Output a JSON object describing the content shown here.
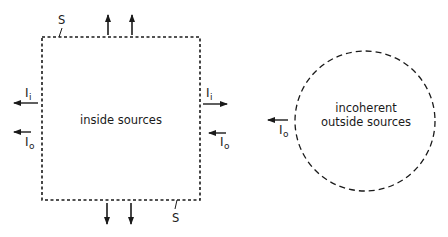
{
  "diagram": {
    "type": "radiation-surface-schematic",
    "colors": {
      "stroke": "#1a1a1a",
      "background": "#ffffff"
    },
    "surface": {
      "label_top": "S",
      "label_bottom": "S",
      "style": "dotted-rectangle",
      "inner_text": "inside sources"
    },
    "outside_region": {
      "style": "dashed-circle",
      "text_line1": "incoherent",
      "text_line2": "outside sources"
    },
    "intensities": {
      "inside_symbol": "I",
      "inside_subscript": "i",
      "outside_symbol": "I",
      "outside_subscript": "o"
    },
    "arrows": {
      "top": [
        "up",
        "up"
      ],
      "bottom": [
        "down",
        "down"
      ],
      "left_Ii": "left",
      "left_Io": "left",
      "right_Ii": "right",
      "right_Io": "left",
      "circle_Io": "left"
    }
  }
}
